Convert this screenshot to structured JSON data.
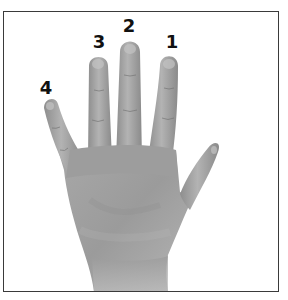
{
  "figure": {
    "style": "grayscale-photo",
    "colors": {
      "border": "#3a3a3a",
      "background": "#ffffff",
      "label": "#111111",
      "skin_light": "#b9b9b9",
      "skin_mid": "#9a9a9a",
      "skin_dark": "#6f6f6f"
    }
  },
  "labels": [
    {
      "finger": "index",
      "text": "1",
      "x": 172,
      "y": 33
    },
    {
      "finger": "middle",
      "text": "2",
      "x": 129,
      "y": 17
    },
    {
      "finger": "ring",
      "text": "3",
      "x": 99,
      "y": 33
    },
    {
      "finger": "little",
      "text": "4",
      "x": 46,
      "y": 79
    }
  ]
}
